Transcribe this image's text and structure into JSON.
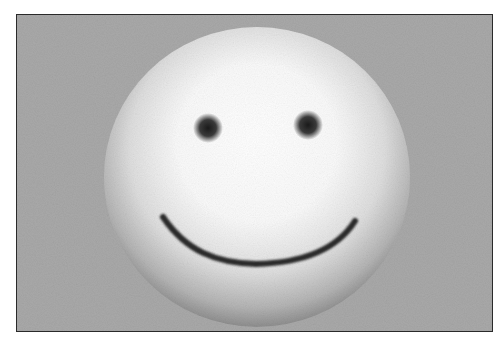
{
  "image": {
    "subject": "3D rendered smiley face sphere on gray background",
    "alt": "White shaded sphere with two dark eyes and a curved smile",
    "colors": {
      "background": "#a9a9a9",
      "frame_border": "#2a2a2a",
      "sphere_highlight": "#ffffff",
      "sphere_shadow": "#8c8c8c",
      "features": "#2b2b2b"
    }
  }
}
